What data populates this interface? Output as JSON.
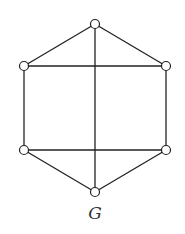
{
  "graph": {
    "label": "G",
    "vertices": [
      {
        "id": "top",
        "x": 95,
        "y": 24
      },
      {
        "id": "upper-left",
        "x": 24,
        "y": 66
      },
      {
        "id": "upper-right",
        "x": 166,
        "y": 66
      },
      {
        "id": "lower-left",
        "x": 24,
        "y": 150
      },
      {
        "id": "lower-right",
        "x": 166,
        "y": 150
      },
      {
        "id": "bottom",
        "x": 95,
        "y": 192
      }
    ],
    "edges": [
      [
        "top",
        "upper-left"
      ],
      [
        "top",
        "upper-right"
      ],
      [
        "upper-left",
        "lower-left"
      ],
      [
        "upper-right",
        "lower-right"
      ],
      [
        "lower-left",
        "bottom"
      ],
      [
        "lower-right",
        "bottom"
      ],
      [
        "top",
        "bottom"
      ],
      [
        "upper-left",
        "upper-right"
      ],
      [
        "lower-left",
        "lower-right"
      ]
    ],
    "colors": {
      "stroke": "#222222",
      "vertex_fill": "#ffffff"
    }
  }
}
